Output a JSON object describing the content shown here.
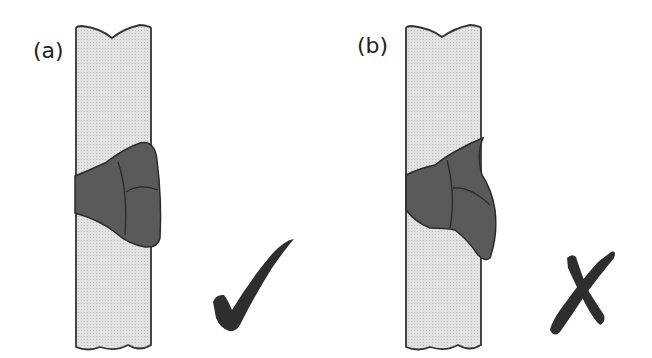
{
  "diagram": {
    "panels": [
      {
        "id": "a",
        "label": "(a)",
        "verdict": "correct",
        "verdict_icon": "checkmark-icon",
        "description": "Symmetric weld bead on plate"
      },
      {
        "id": "b",
        "label": "(b)",
        "verdict": "incorrect",
        "verdict_icon": "cross-icon",
        "description": "Asymmetric, sagging weld bead on plate"
      }
    ],
    "colors": {
      "plate_fill": "#dcdcdc",
      "plate_stroke": "#333333",
      "weld_fill": "#5a5a5a",
      "weld_stroke": "#2a2a2a",
      "mark": "#2e2e2e"
    }
  }
}
